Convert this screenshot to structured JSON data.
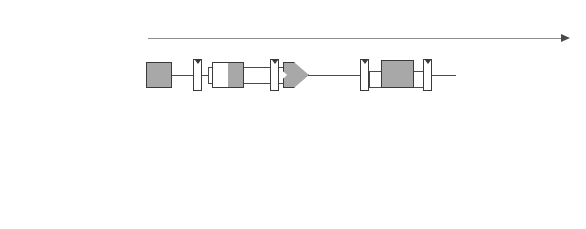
{
  "diagram": {
    "axis": {
      "label": "時間（サイクル）",
      "cycles": [
        "1",
        "2",
        "3",
        "4",
        "5",
        "6",
        "7",
        "8"
      ]
    },
    "hazard": {
      "annotation": "Trouble!",
      "color": "#3f9fe0",
      "guide_color": "#b9dcf2"
    },
    "colors": {
      "active_unit": "#a8a8a8",
      "idle_unit": "#ffffff",
      "wire": "#4a4a4a",
      "border": "#3a3a3a"
    },
    "stage_names": {
      "fetch": "IM",
      "decode": "RF",
      "execute": "ALU",
      "memory": "DM",
      "writeback": "RF"
    },
    "rows": [
      {
        "instruction": "LDR R1, [R4, #40]",
        "start_cycle": 1,
        "im": "IM",
        "im_active": true,
        "im_out": "LDR",
        "rf": "RF",
        "rf_active": true,
        "operand_top": "R4",
        "operand_bottom": "40",
        "alu_op": "+",
        "alu_active": true,
        "dm": "DM",
        "dm_active": true,
        "result": "R1",
        "wb": "RF",
        "wb_active": false
      },
      {
        "instruction": "AND R8, R1, R3",
        "start_cycle": 2,
        "im": "IM",
        "im_active": true,
        "im_out": "AND",
        "rf": "RF",
        "rf_active": true,
        "operand_top": "R1",
        "operand_bottom": "R3",
        "alu_op": "&",
        "alu_active": true,
        "dm": "DM",
        "dm_active": false,
        "result": "R8",
        "wb": "RF",
        "wb_active": true
      },
      {
        "instruction": "ORR R9, R6, R1",
        "start_cycle": 3,
        "im": "IM",
        "im_active": true,
        "im_out": "ORR",
        "rf": "RF",
        "rf_active": true,
        "operand_top": "R6",
        "operand_bottom": "R1",
        "alu_op": "|",
        "alu_active": true,
        "dm": "DM",
        "dm_active": false,
        "result": "R9",
        "wb": "RF",
        "wb_active": true
      },
      {
        "instruction": "SUB R10, R1, R7",
        "start_cycle": 4,
        "im": "IM",
        "im_active": true,
        "im_out": "SUB",
        "rf": "RF",
        "rf_active": true,
        "operand_top": "R1",
        "operand_bottom": "R7",
        "alu_op": "-",
        "alu_active": true,
        "dm": "DM",
        "dm_active": false,
        "result": "R10",
        "wb": "RF",
        "wb_active": true
      }
    ]
  }
}
